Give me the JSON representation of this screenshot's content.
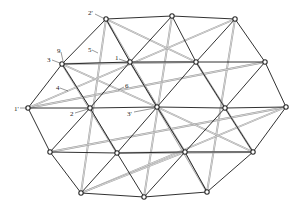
{
  "diagram": {
    "title": "",
    "colors": {
      "strut_dark": "#1a1a1a",
      "strut_light": "#9a9a9a",
      "node": "#2a2a2a",
      "background": "#ffffff"
    },
    "nodes": [
      {
        "id": "t1",
        "x": 106,
        "y": 19
      },
      {
        "id": "t2",
        "x": 172,
        "y": 16
      },
      {
        "id": "t3",
        "x": 235,
        "y": 19
      },
      {
        "id": "a1",
        "x": 62,
        "y": 64
      },
      {
        "id": "a2",
        "x": 130,
        "y": 62
      },
      {
        "id": "a3",
        "x": 196,
        "y": 62
      },
      {
        "id": "a4",
        "x": 265,
        "y": 62
      },
      {
        "id": "b1",
        "x": 28,
        "y": 108
      },
      {
        "id": "b2",
        "x": 90,
        "y": 108
      },
      {
        "id": "b3",
        "x": 157,
        "y": 107
      },
      {
        "id": "b4",
        "x": 225,
        "y": 108
      },
      {
        "id": "b5",
        "x": 286,
        "y": 107
      },
      {
        "id": "c1",
        "x": 50,
        "y": 152
      },
      {
        "id": "c2",
        "x": 117,
        "y": 153
      },
      {
        "id": "c3",
        "x": 185,
        "y": 152
      },
      {
        "id": "c4",
        "x": 253,
        "y": 152
      },
      {
        "id": "d1",
        "x": 81,
        "y": 193
      },
      {
        "id": "d2",
        "x": 144,
        "y": 197
      },
      {
        "id": "d3",
        "x": 207,
        "y": 192
      }
    ],
    "dark_edges": [
      [
        "t1",
        "t2"
      ],
      [
        "t2",
        "t3"
      ],
      [
        "d1",
        "d2"
      ],
      [
        "d2",
        "d3"
      ],
      [
        "a1",
        "a2"
      ],
      [
        "a2",
        "a3"
      ],
      [
        "a3",
        "a4"
      ],
      [
        "b1",
        "b2"
      ],
      [
        "b2",
        "b3"
      ],
      [
        "b3",
        "b4"
      ],
      [
        "b4",
        "b5"
      ],
      [
        "c1",
        "c2"
      ],
      [
        "c2",
        "c3"
      ],
      [
        "c3",
        "c4"
      ],
      [
        "t1",
        "a1"
      ],
      [
        "t1",
        "a2"
      ],
      [
        "t2",
        "a2"
      ],
      [
        "t2",
        "a3"
      ],
      [
        "t3",
        "a3"
      ],
      [
        "t3",
        "a4"
      ],
      [
        "a1",
        "b1"
      ],
      [
        "a1",
        "b2"
      ],
      [
        "a2",
        "b2"
      ],
      [
        "a2",
        "b3"
      ],
      [
        "a3",
        "b3"
      ],
      [
        "a3",
        "b4"
      ],
      [
        "a4",
        "b4"
      ],
      [
        "a4",
        "b5"
      ],
      [
        "b1",
        "c1"
      ],
      [
        "b2",
        "c1"
      ],
      [
        "b2",
        "c2"
      ],
      [
        "b3",
        "c2"
      ],
      [
        "b3",
        "c3"
      ],
      [
        "b4",
        "c3"
      ],
      [
        "b4",
        "c4"
      ],
      [
        "b5",
        "c4"
      ],
      [
        "c1",
        "d1"
      ],
      [
        "c2",
        "d1"
      ],
      [
        "c2",
        "d2"
      ],
      [
        "c3",
        "d2"
      ],
      [
        "c3",
        "d3"
      ],
      [
        "c4",
        "d3"
      ]
    ],
    "light_edges": [
      [
        "t1",
        "d1"
      ],
      [
        "t2",
        "d2"
      ],
      [
        "t3",
        "d3"
      ],
      [
        "a1",
        "c2"
      ],
      [
        "a2",
        "c3"
      ],
      [
        "a3",
        "c4"
      ],
      [
        "b1",
        "a4"
      ],
      [
        "c1",
        "b5"
      ],
      [
        "b1",
        "t3"
      ],
      [
        "d1",
        "b5"
      ],
      [
        "t1",
        "b3"
      ],
      [
        "a1",
        "b3"
      ],
      [
        "b3",
        "c4"
      ],
      [
        "b3",
        "d3"
      ],
      [
        "t1",
        "a3"
      ],
      [
        "a1",
        "a3"
      ],
      [
        "c2",
        "c4"
      ],
      [
        "d1",
        "c3"
      ]
    ],
    "labels": [
      {
        "text": "2'",
        "x": 88,
        "y": 15,
        "lx1": 95,
        "ly1": 14,
        "lx2": 105,
        "ly2": 19
      },
      {
        "text": "9",
        "x": 57,
        "y": 53,
        "lx1": 61,
        "ly1": 52,
        "lx2": 63,
        "ly2": 61
      },
      {
        "text": "3",
        "x": 47,
        "y": 62,
        "lx1": 52,
        "ly1": 60,
        "lx2": 60,
        "ly2": 63
      },
      {
        "text": "5",
        "x": 88,
        "y": 52,
        "lx1": 92,
        "ly1": 50,
        "lx2": 98,
        "ly2": 53
      },
      {
        "text": "1",
        "x": 115,
        "y": 60,
        "lx1": 119,
        "ly1": 59,
        "lx2": 128,
        "ly2": 62
      },
      {
        "text": "4",
        "x": 56,
        "y": 90,
        "lx1": 60,
        "ly1": 88,
        "lx2": 68,
        "ly2": 91
      },
      {
        "text": "6",
        "x": 125,
        "y": 88,
        "lx1": 124,
        "ly1": 87,
        "lx2": 118,
        "ly2": 90
      },
      {
        "text": "1'",
        "x": 14,
        "y": 111,
        "lx1": 20,
        "ly1": 108,
        "lx2": 27,
        "ly2": 108
      },
      {
        "text": "2",
        "x": 70,
        "y": 116,
        "lx1": 75,
        "ly1": 113,
        "lx2": 88,
        "ly2": 109
      },
      {
        "text": "3'",
        "x": 127,
        "y": 116,
        "lx1": 134,
        "ly1": 112,
        "lx2": 155,
        "ly2": 108
      }
    ]
  }
}
